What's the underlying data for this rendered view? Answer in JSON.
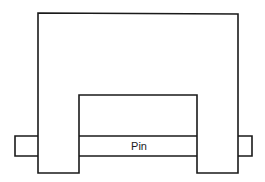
{
  "diagram": {
    "type": "mechanical-schematic",
    "components": [
      {
        "id": "clevis-body",
        "shape": "inverted-U bracket"
      },
      {
        "id": "pin",
        "label": "Pin"
      }
    ],
    "pin": {
      "label": "Pin"
    },
    "colors": {
      "stroke": "#1a1a1a",
      "background": "#ffffff"
    }
  }
}
